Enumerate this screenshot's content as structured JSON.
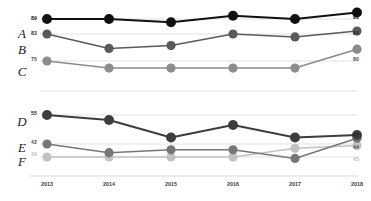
{
  "chart_data": {
    "type": "line",
    "title": "",
    "subtitle": "",
    "xlabel": "",
    "ylabel": "",
    "grid": true,
    "legend_position": "row-labels-left",
    "categories": [
      "2013",
      "2014",
      "2015",
      "2016",
      "2017",
      "2018"
    ],
    "x": [
      2013,
      2014,
      2015,
      2016,
      2017,
      2018
    ],
    "groups": [
      {
        "name": "upper-group",
        "series": [
          "A",
          "B",
          "C"
        ]
      },
      {
        "name": "lower-group",
        "series": [
          "D",
          "E",
          "F"
        ]
      }
    ],
    "series": [
      {
        "name": "A",
        "label": "A",
        "group": 0,
        "color": "#111111",
        "values": [
          89,
          89,
          88,
          90,
          89,
          91
        ],
        "start_label": "89",
        "end_label": "91",
        "baseline": 89,
        "range": [
          84,
          92
        ]
      },
      {
        "name": "B",
        "label": "B",
        "group": 0,
        "color": "#5a5a5a",
        "values": [
          83,
          78,
          79,
          83,
          82,
          84
        ],
        "start_label": "83",
        "end_label": "84",
        "baseline": 83,
        "range": [
          76,
          85
        ]
      },
      {
        "name": "C",
        "label": "C",
        "group": 0,
        "color": "#8c8c8c",
        "values": [
          75,
          72,
          72,
          72,
          72,
          80
        ],
        "start_label": "75",
        "end_label": "80",
        "baseline": 75,
        "range": [
          70,
          81
        ]
      },
      {
        "name": "D",
        "label": "D",
        "group": 1,
        "color": "#3d3d3d",
        "values": [
          55,
          53,
          46,
          51,
          46,
          47
        ],
        "start_label": "55",
        "end_label": "47",
        "baseline": 55,
        "range": [
          44,
          56
        ]
      },
      {
        "name": "E",
        "label": "E",
        "group": 1,
        "color": "#777777",
        "values": [
          42,
          39,
          40,
          40,
          37,
          44
        ],
        "start_label": "42",
        "end_label": "44",
        "baseline": 42,
        "range": [
          36,
          45
        ]
      },
      {
        "name": "F",
        "label": "F",
        "group": 1,
        "color": "#c2c2c2",
        "values": [
          39,
          39,
          39,
          39,
          42,
          43
        ],
        "start_label": "39",
        "end_label": "43",
        "baseline": 39,
        "range": [
          36,
          45
        ]
      }
    ],
    "axis": {
      "x_ticks": [
        "2013",
        "2014",
        "2015",
        "2016",
        "2017",
        "2018"
      ],
      "x_tick_count": 6
    },
    "colors": {
      "series_a": "#111111",
      "series_b": "#5a5a5a",
      "series_c": "#8c8c8c",
      "series_d": "#3d3d3d",
      "series_e": "#777777",
      "series_f": "#c2c2c2",
      "gridline": "#d6d6d6",
      "axis_text": "#3a3a3a",
      "background": "#ffffff"
    }
  }
}
